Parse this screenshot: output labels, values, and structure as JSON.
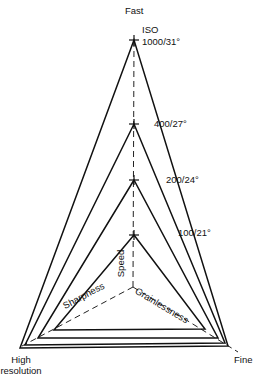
{
  "diagram": {
    "type": "radar-triangle",
    "axes": {
      "top": "Fast",
      "bottom_left": [
        "High",
        "resolution"
      ],
      "bottom_right": "Fine"
    },
    "inner_axes": {
      "speed": "Speed",
      "sharpness": "Sharpness",
      "grainlessness": "Grainlessness"
    },
    "iso_header": "ISO",
    "films": [
      {
        "label": "1000/31°"
      },
      {
        "label": "400/27°"
      },
      {
        "label": "200/24°"
      },
      {
        "label": "100/21°"
      }
    ],
    "line_color": "#111111"
  }
}
